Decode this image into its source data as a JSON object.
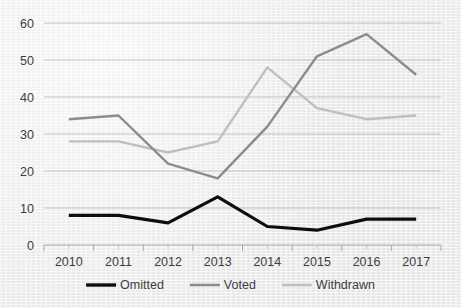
{
  "chart_data": {
    "type": "line",
    "title": "",
    "subtitle": "",
    "xlabel": "",
    "ylabel": "",
    "categories": [
      "2010",
      "2011",
      "2012",
      "2013",
      "2014",
      "2015",
      "2016",
      "2017"
    ],
    "x": [
      2010,
      2011,
      2012,
      2013,
      2014,
      2015,
      2016,
      2017
    ],
    "ylim": [
      0,
      60
    ],
    "yticks": [
      0,
      10,
      20,
      30,
      40,
      50,
      60
    ],
    "ytick_labels": [
      "0",
      "10",
      "20",
      "30",
      "40",
      "50",
      "60"
    ],
    "grid": true,
    "grid_axis": "y",
    "legend_position": "bottom",
    "series": [
      {
        "name": "Omitted",
        "color": "#0d0d0d",
        "line_width": 3.2,
        "values": [
          8,
          8,
          6,
          13,
          5,
          4,
          7,
          7
        ]
      },
      {
        "name": "Voted",
        "color": "#8c8c8c",
        "line_width": 2.4,
        "values": [
          34,
          35,
          22,
          18,
          32,
          51,
          57,
          46
        ]
      },
      {
        "name": "Withdrawn",
        "color": "#bfbfbf",
        "line_width": 2.4,
        "values": [
          28,
          28,
          25,
          28,
          48,
          37,
          34,
          35
        ]
      }
    ]
  },
  "legend": {
    "items": [
      {
        "label": "Omitted",
        "color": "#0d0d0d",
        "line_width": 3.4
      },
      {
        "label": "Voted",
        "color": "#8c8c8c",
        "line_width": 2.6
      },
      {
        "label": "Withdrawn",
        "color": "#bfbfbf",
        "line_width": 2.6
      }
    ]
  },
  "style": {
    "background": "#efefef",
    "gridline_color": "#bdbdbd",
    "axis_color": "#a8a8a8",
    "text_color": "#3d3d3d"
  }
}
